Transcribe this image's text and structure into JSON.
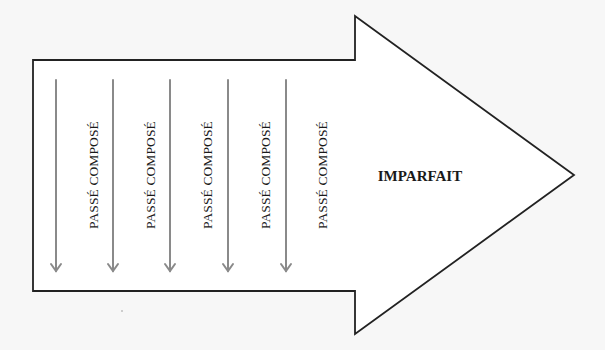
{
  "diagram": {
    "main_arrow": {
      "label": "IMPARFAIT",
      "fill": "#ffffff",
      "stroke": "#222222"
    },
    "columns": [
      {
        "label": "PASSÉ COMPOSÉ"
      },
      {
        "label": "PASSÉ COMPOSÉ"
      },
      {
        "label": "PASSÉ COMPOSÉ"
      },
      {
        "label": "PASSÉ COMPOSÉ"
      },
      {
        "label": "PASSÉ COMPOSÉ"
      }
    ],
    "column_arrow_color": "#8a8a8a",
    "background": "#f7f7f7"
  }
}
